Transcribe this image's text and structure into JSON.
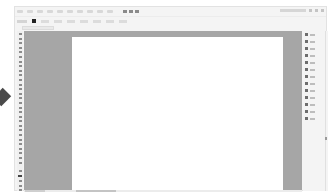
{
  "app": {
    "type": "vector-graphics editor workspace",
    "menu_bar": {
      "item_count": 10,
      "labels_legible": false,
      "icon_count": 3
    },
    "window": {
      "label_legible": false,
      "controls": [
        "minimize",
        "maximize",
        "close"
      ]
    },
    "control_bar": {
      "fill_swatch_color": "#222222",
      "labels_legible": false
    },
    "document_tab": {
      "title_legible": false
    },
    "toolbar": {
      "tool_count": 30,
      "fill_stroke_swatch": true
    },
    "canvas": {
      "pasteboard_color": "#a6a6a6",
      "artboard_color": "#ffffff"
    },
    "panel_dock": {
      "item_count": 13,
      "labels_legible": false
    }
  },
  "overlay": {
    "left_arrow_marker": true,
    "marker_color": "#4a4a4a"
  }
}
